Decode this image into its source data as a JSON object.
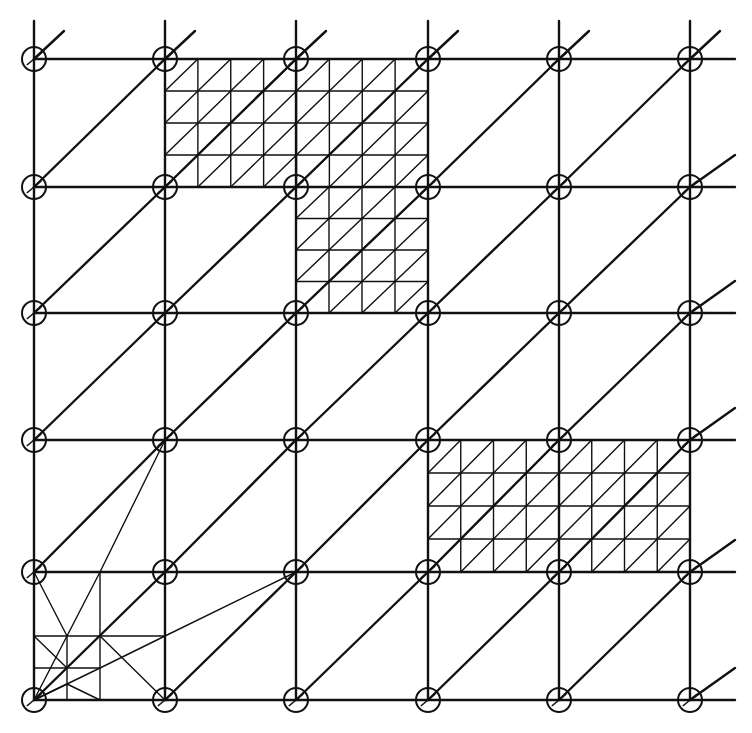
{
  "diagram": {
    "type": "finite-element-mesh",
    "colors": {
      "stroke": "#111111",
      "background": "#ffffff"
    },
    "grid": {
      "columns_x": [
        34,
        165,
        296,
        428,
        559,
        690
      ],
      "rows_y": [
        59,
        187,
        313,
        440,
        572,
        700
      ],
      "extend": {
        "top": 38,
        "right": 45
      },
      "node_radius": 12,
      "diagonal_direction": "bottom-left-to-top-right"
    },
    "refined_patches": [
      {
        "name": "top-patch",
        "cells": {
          "col_start": 1,
          "col_end": 3,
          "row_start": 0,
          "row_end": 1
        },
        "subdivisions_per_cell": 4
      },
      {
        "name": "upper-middle-patch",
        "cells": {
          "col_start": 2,
          "col_end": 3,
          "row_start": 1,
          "row_end": 2
        },
        "subdivisions_per_cell": 4
      },
      {
        "name": "right-patch",
        "cells": {
          "col_start": 3,
          "col_end": 5,
          "row_start": 3,
          "row_end": 4
        },
        "subdivisions_per_cell": 4
      }
    ],
    "corner_refinement": {
      "name": "bottom-left-fan",
      "origin": [
        34,
        700
      ],
      "fine_lines": [
        [
          [
            100,
            572
          ],
          [
            100,
            700
          ]
        ],
        [
          [
            34,
            636
          ],
          [
            165,
            636
          ]
        ],
        [
          [
            34,
            668
          ],
          [
            100,
            668
          ]
        ],
        [
          [
            67,
            636
          ],
          [
            67,
            700
          ]
        ],
        [
          [
            34,
            572
          ],
          [
            67,
            636
          ]
        ],
        [
          [
            34,
            636
          ],
          [
            67,
            668
          ]
        ],
        [
          [
            34,
            700
          ],
          [
            67,
            636
          ]
        ],
        [
          [
            67,
            636
          ],
          [
            100,
            572
          ]
        ],
        [
          [
            100,
            572
          ],
          [
            165,
            440
          ]
        ],
        [
          [
            34,
            700
          ],
          [
            100,
            668
          ]
        ],
        [
          [
            100,
            668
          ],
          [
            165,
            636
          ]
        ],
        [
          [
            165,
            636
          ],
          [
            296,
            572
          ]
        ],
        [
          [
            34,
            700
          ],
          [
            67,
            684
          ]
        ],
        [
          [
            67,
            684
          ],
          [
            100,
            700
          ]
        ],
        [
          [
            100,
            636
          ],
          [
            165,
            700
          ]
        ]
      ]
    }
  }
}
